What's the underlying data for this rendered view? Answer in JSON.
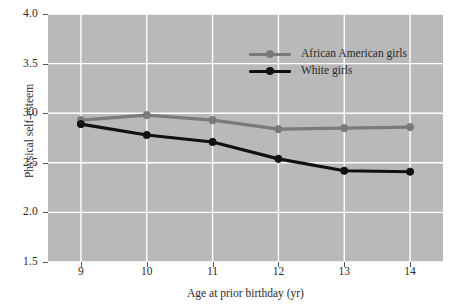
{
  "chart_data": {
    "type": "line",
    "title": "",
    "xlabel": "Age at prior birthday (yr)",
    "ylabel": "Physical self-esteem",
    "x": [
      9,
      10,
      11,
      12,
      13,
      14
    ],
    "xticklabels": [
      "9",
      "10",
      "11",
      "12",
      "13",
      "14"
    ],
    "yticklabels": [
      "1.5",
      "2.0",
      "2.5",
      "3.0",
      "3.5",
      "4.0"
    ],
    "yticks": [
      1.5,
      2.0,
      2.5,
      3.0,
      3.5,
      4.0
    ],
    "xlim": [
      8.5,
      14.5
    ],
    "ylim": [
      1.5,
      4.0
    ],
    "grid": true,
    "grid_color": "#ffffff",
    "plot_background": "#b9b9b9",
    "legend_position": "upper right",
    "series": [
      {
        "name": "African American girls",
        "color": "#7a7a7a",
        "marker": "circle",
        "values": [
          2.93,
          2.98,
          2.93,
          2.84,
          2.85,
          2.86
        ]
      },
      {
        "name": "White girls",
        "color": "#111111",
        "marker": "circle",
        "values": [
          2.89,
          2.78,
          2.71,
          2.54,
          2.42,
          2.41
        ]
      }
    ]
  },
  "legend": {
    "entries": [
      {
        "label": "African American girls"
      },
      {
        "label": "White girls"
      }
    ]
  },
  "axes": {
    "x_title": "Age at prior birthday (yr)",
    "y_title": "Physical self-esteem"
  }
}
